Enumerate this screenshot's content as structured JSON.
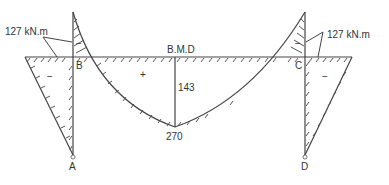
{
  "diagram": {
    "title": "B.M.D",
    "moment_labels": {
      "left_support_moment": "127 kN.m",
      "right_support_moment": "127 kN.m",
      "midspan_net": "143",
      "midspan_free": "270"
    },
    "sign_labels": {
      "left_column": "−",
      "left_hogging": "−",
      "sagging": "+",
      "right_hogging": "−",
      "right_column": "−",
      "beam_right": "−"
    },
    "nodes": {
      "A": "A",
      "B": "B",
      "C": "C",
      "D": "D"
    },
    "colors": {
      "line": "#444444",
      "text": "#333333",
      "background": "#ffffff"
    }
  }
}
